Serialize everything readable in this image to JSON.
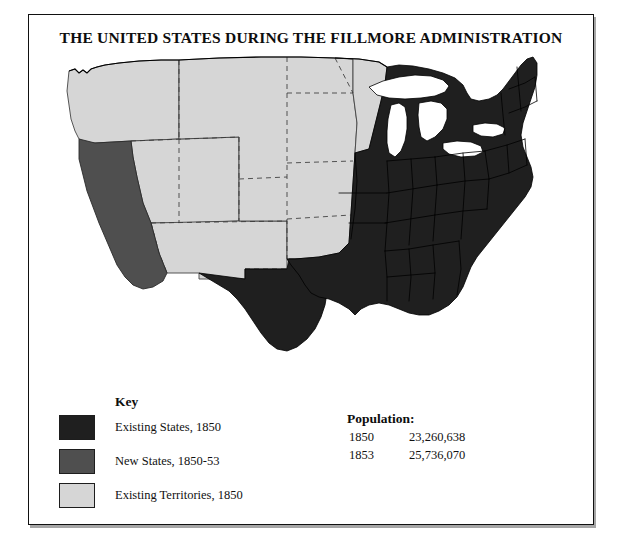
{
  "title": "THE UNITED STATES DURING THE FILLMORE ADMINISTRATION",
  "colors": {
    "existing_states": "#1f1f1f",
    "new_states": "#4f4f4f",
    "territories": "#d6d6d6",
    "water": "#ffffff",
    "border": "#111111",
    "background": "#ffffff"
  },
  "legend": {
    "heading": "Key",
    "items": [
      {
        "label": "Existing States, 1850",
        "color": "#1f1f1f"
      },
      {
        "label": "New States, 1850-53",
        "color": "#4f4f4f"
      },
      {
        "label": "Existing Territories, 1850",
        "color": "#d6d6d6"
      }
    ]
  },
  "population": {
    "heading": "Population:",
    "rows": [
      {
        "year": "1850",
        "value": "23,260,638"
      },
      {
        "year": "1853",
        "value": "25,736,070"
      }
    ]
  },
  "map": {
    "regions": [
      {
        "name": "pacific-northwest-territory",
        "category": "territory"
      },
      {
        "name": "california",
        "category": "new_state"
      },
      {
        "name": "utah-territory",
        "category": "territory"
      },
      {
        "name": "new-mexico-territory",
        "category": "territory"
      },
      {
        "name": "unorganized-plains-territory",
        "category": "territory"
      },
      {
        "name": "minnesota-territory",
        "category": "territory"
      },
      {
        "name": "texas",
        "category": "existing_state"
      },
      {
        "name": "eastern-states",
        "category": "existing_state"
      },
      {
        "name": "great-lakes",
        "category": "water"
      }
    ]
  }
}
